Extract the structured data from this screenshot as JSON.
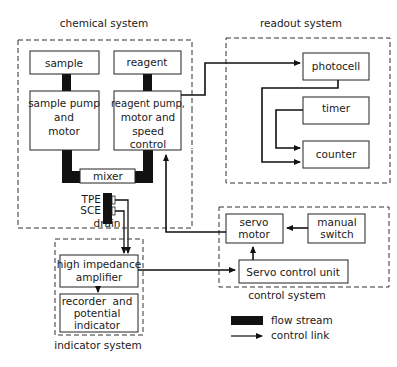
{
  "systems": {
    "chemical": "chemical system",
    "readout": "readout system",
    "control": "control system",
    "indicator": "indicator system"
  },
  "blocks": {
    "sample": "sample",
    "reagent": "reagent",
    "sample_pump": [
      "sample pump",
      "and",
      "motor"
    ],
    "reagent_pump": [
      "reagent pump,",
      "motor and",
      "speed",
      "control"
    ],
    "mixer": "mixer",
    "tpe": "TPE",
    "sce": "SCE",
    "drain": "drain",
    "photocell": "photocell",
    "timer": "timer",
    "counter": "counter",
    "servo_motor": [
      "servo",
      "motor"
    ],
    "manual_switch": [
      "manual",
      "switch"
    ],
    "servo_control_unit": "Servo control unit",
    "amplifier": [
      "high impedance",
      "amplifier"
    ],
    "recorder": [
      "recorder  and",
      "potential",
      "indicator"
    ]
  },
  "legend": {
    "flow": "flow stream",
    "control": "control link"
  },
  "colors": {
    "line": "#111111",
    "background": "#ffffff"
  }
}
